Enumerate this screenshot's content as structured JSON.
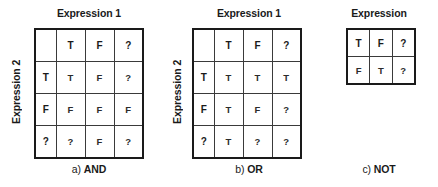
{
  "figure": {
    "truth_values": [
      "T",
      "F",
      "?"
    ],
    "panels": [
      {
        "id": "and",
        "col_heading": "Expression 1",
        "row_heading": "Expression 2",
        "caption_index": "a)",
        "caption_op": "AND",
        "caption_full": "a) AND",
        "corner": "",
        "col_headers": [
          "T",
          "F",
          "?"
        ],
        "row_headers": [
          "T",
          "F",
          "?"
        ],
        "rows": [
          [
            "T",
            "F",
            "?"
          ],
          [
            "F",
            "F",
            "F"
          ],
          [
            "?",
            "F",
            "?"
          ]
        ]
      },
      {
        "id": "or",
        "col_heading": "Expression 1",
        "row_heading": "Expression 2",
        "caption_index": "b)",
        "caption_op": "OR",
        "caption_full": "b) OR",
        "corner": "",
        "col_headers": [
          "T",
          "F",
          "?"
        ],
        "row_headers": [
          "T",
          "F",
          "?"
        ],
        "rows": [
          [
            "T",
            "T",
            "T"
          ],
          [
            "T",
            "F",
            "?"
          ],
          [
            "T",
            "?",
            "?"
          ]
        ]
      },
      {
        "id": "not",
        "col_heading": "Expression",
        "caption_index": "c)",
        "caption_op": "NOT",
        "caption_full": "c) NOT",
        "col_headers": [
          "T",
          "F",
          "?"
        ],
        "rows": [
          [
            "F",
            "T",
            "?"
          ]
        ]
      }
    ]
  },
  "colors": {
    "background": "#ffffff",
    "text": "#1a1a1a",
    "table_outer_border": "#1a1a1a",
    "table_inner_border": "#3a3a3a"
  }
}
